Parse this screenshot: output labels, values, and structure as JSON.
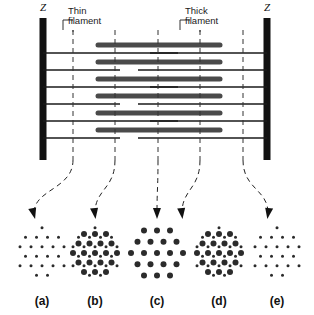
{
  "figure": {
    "background": "#ffffff",
    "ink": "#1a1a1a",
    "filament_color": "#4a4a4a",
    "zdisc_color": "#111111"
  },
  "labels": {
    "z_left": "Z",
    "z_right": "Z",
    "thin_filament": "Thin\nfilament",
    "thick_filament": "Thick\nfilament"
  },
  "sarcomere": {
    "zdisc_left_x": 43,
    "zdisc_right_x": 267,
    "zdisc_top": 18,
    "zdisc_bottom": 160,
    "zdisc_width": 7,
    "thin_rows_y": [
      53,
      70,
      87,
      104,
      121,
      138
    ],
    "thick_rows_y": [
      45,
      62,
      79,
      96,
      113,
      130
    ],
    "thick_start_x": 98,
    "thick_end_x": 220,
    "thick_thickness": 5,
    "thin_thickness": 1.4,
    "section_lines_x": [
      73,
      115,
      158,
      200,
      243
    ],
    "section_line_top": 30,
    "section_line_bottom": 160
  },
  "arrows": [
    {
      "name": "arrow-to-a",
      "from_x": 73,
      "to_x": 34,
      "from_y": 160,
      "to_y": 213
    },
    {
      "name": "arrow-to-b",
      "from_x": 115,
      "to_x": 95,
      "from_y": 160,
      "to_y": 213
    },
    {
      "name": "arrow-to-c",
      "from_x": 158,
      "to_x": 157,
      "from_y": 160,
      "to_y": 213
    },
    {
      "name": "arrow-to-d",
      "from_x": 200,
      "to_x": 182,
      "from_y": 160,
      "to_y": 213
    },
    {
      "name": "arrow-to-e",
      "from_x": 243,
      "to_x": 268,
      "from_y": 160,
      "to_y": 213
    }
  ],
  "cross_sections": [
    {
      "label": "(a)",
      "name": "cross-section-a",
      "center_x": 42,
      "center_y": 253,
      "content": "thin-only",
      "thick_radius": 0,
      "thin_radius": 1.5,
      "lattice_spacing": 11,
      "rows": 5,
      "show_thick": false,
      "show_thin": true
    },
    {
      "label": "(b)",
      "name": "cross-section-b",
      "center_x": 95,
      "center_y": 253,
      "content": "overlap",
      "thick_radius": 3,
      "thin_radius": 1.5,
      "lattice_spacing": 11,
      "rows": 5,
      "show_thick": true,
      "show_thin": true
    },
    {
      "label": "(c)",
      "name": "cross-section-c",
      "center_x": 157,
      "center_y": 253,
      "content": "thick-only",
      "thick_radius": 3,
      "thin_radius": 0,
      "lattice_spacing": 13,
      "rows": 5,
      "show_thick": true,
      "show_thin": false
    },
    {
      "label": "(d)",
      "name": "cross-section-d",
      "center_x": 219,
      "center_y": 253,
      "content": "overlap",
      "thick_radius": 3,
      "thin_radius": 1.5,
      "lattice_spacing": 11,
      "rows": 5,
      "show_thick": true,
      "show_thin": true
    },
    {
      "label": "(e)",
      "name": "cross-section-e",
      "center_x": 277,
      "center_y": 253,
      "content": "thin-only",
      "thick_radius": 0,
      "thin_radius": 1.5,
      "lattice_spacing": 11,
      "rows": 5,
      "show_thick": false,
      "show_thin": true
    }
  ],
  "panel_label_y": 295
}
